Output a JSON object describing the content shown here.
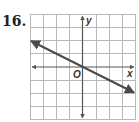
{
  "problem": {
    "number": "16."
  },
  "graph": {
    "grid": {
      "columns": 8,
      "rows": 8,
      "x_range": [
        -4,
        4
      ],
      "y_range": [
        -4,
        4
      ],
      "grid_color": "#b8b8b8",
      "axis_color": "#555555"
    },
    "axes": {
      "x_label": "x",
      "y_label": "y",
      "origin_label": "O"
    },
    "line": {
      "color": "#4a4a4a",
      "passes_through": [
        [
          0,
          0
        ]
      ],
      "slope": -0.5,
      "from": [
        -4,
        2
      ],
      "to": [
        4,
        -2
      ],
      "arrows": "both"
    }
  }
}
